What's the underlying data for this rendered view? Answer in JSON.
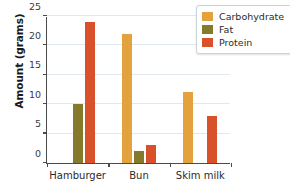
{
  "chart_data": {
    "type": "bar",
    "title": "",
    "xlabel": "",
    "ylabel": "Amount (grams)",
    "categories": [
      "Hamburger",
      "Bun",
      "Skim milk"
    ],
    "series": [
      {
        "name": "Carbohydrate",
        "color": "#E4A23F",
        "values": [
          null,
          22,
          12
        ]
      },
      {
        "name": "Fat",
        "color": "#857A2B",
        "values": [
          10,
          2,
          null
        ]
      },
      {
        "name": "Protein",
        "color": "#D9512B",
        "values": [
          24,
          3,
          8
        ]
      }
    ],
    "ylim": [
      0,
      25
    ],
    "yticks": [
      0,
      5,
      10,
      15,
      20,
      25
    ],
    "ytick_labels": [
      "0",
      "5",
      "10",
      "15",
      "20",
      "25"
    ],
    "grid": true,
    "grid_color": "#dfe9ef",
    "legend_position": "top-right",
    "axis_color": "#4a4a4a",
    "background": "#ffffff"
  }
}
